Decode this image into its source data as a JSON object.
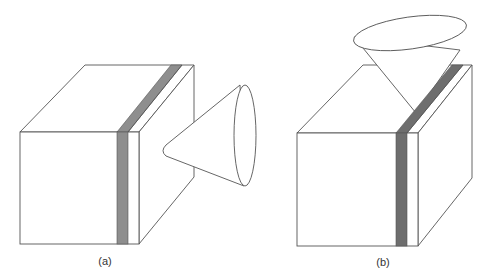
{
  "figure": {
    "panels": [
      {
        "id": "a",
        "label": "(a)",
        "description": "Box with vertical gray layer strip; cone oriented horizontally to the right of box",
        "strip_color": "#8e8e8e"
      },
      {
        "id": "b",
        "label": "(b)",
        "description": "Box with vertical dark gray layer strip; cone oriented vertically above box",
        "strip_color": "#6e6e6e"
      }
    ],
    "line_color": "#555555",
    "background": "#ffffff"
  }
}
